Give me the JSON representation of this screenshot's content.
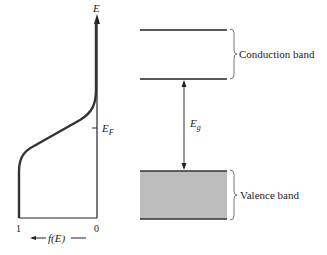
{
  "left_plot": {
    "y_axis_label": "E",
    "fermi_label": "E",
    "fermi_sub": "F",
    "x_tick_left": "1",
    "x_tick_right": "0",
    "x_axis_label": "f(E)",
    "x_axis_arrow": "←"
  },
  "band_diagram": {
    "conduction_label": "Conduction band",
    "valence_label": "Valence band",
    "gap_label": "E",
    "gap_sub": "g",
    "valence_fill": "#bdbdbd",
    "line_color": "#222222"
  }
}
